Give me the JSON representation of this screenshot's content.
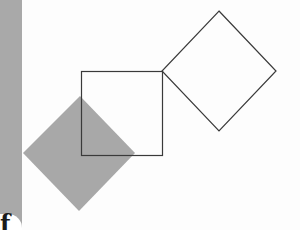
{
  "figure": {
    "colors": {
      "background": "#fdfdfd",
      "strip": "#a9a9a9",
      "filled_diamond": "#a8a8a8",
      "outline": "#3a3a3a"
    },
    "shapes": {
      "square": {
        "x": 81,
        "y": 71,
        "width": 81,
        "height": 84
      },
      "outlined_diamond": {
        "top": [
          219,
          11
        ],
        "right": [
          276,
          71
        ],
        "bottom": [
          219,
          131
        ],
        "left": [
          162,
          71
        ]
      },
      "filled_diamond": {
        "top": [
          80,
          96
        ],
        "right": [
          135,
          153
        ],
        "bottom": [
          79,
          211
        ],
        "left": [
          23,
          153
        ]
      }
    }
  },
  "corner": {
    "glyph": "f"
  }
}
